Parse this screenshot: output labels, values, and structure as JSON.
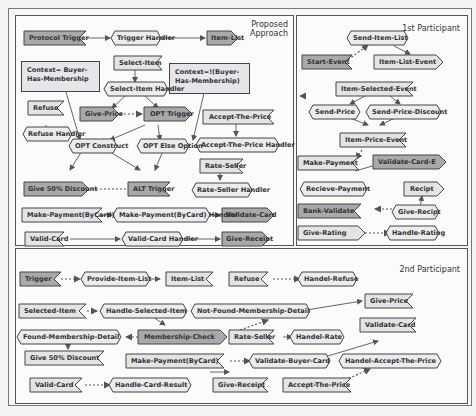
{
  "panels": {
    "proposed": {
      "title_line1": "Proposed",
      "title_line2": "Approach"
    },
    "first": {
      "title": "1st Participant"
    },
    "second": {
      "title": "2nd Participant"
    }
  },
  "colors": {
    "dark_node": "#a9a9ad",
    "light_node": "#e4e4e6",
    "handler_node": "#ececee",
    "border": "#444444"
  },
  "proposed": {
    "protocol_trigger": "Protocol Trigger",
    "trigger_handler": "Trigger Handler",
    "item_list": "Item-List",
    "select_item": "Select-Item",
    "context_has": "Context= Buyer-Has-Membership",
    "context_not": "Context=!(Buyer-Has-Membership)",
    "select_item_handler": "Select-Item Handler",
    "refuse": "Refuse",
    "refuse_handler": "Refuse Handler",
    "give_price": "Give-Price",
    "opt_trigger": "OPT Trigger",
    "accept_the_price": "Accept-The-Price",
    "accept_the_price_handler": "Accept-The-Price Handler",
    "opt_construct": "OPT Construct",
    "opt_else_option": "OPT Else Option",
    "rate_seller": "Rate-Seller",
    "rate_seller_handler": "Rate-Seller Handler",
    "give_50_discount": "Give 50% Discount",
    "alt_trigger": "ALT Trigger",
    "make_payment": "Make-Payment(ByCard)",
    "make_payment_handler": "Make-Payment(ByCard) Handler",
    "validate_card": "Validate-Card",
    "valid_card": "Valid-Card",
    "valid_card_handler": "Valid-Card Handler",
    "give_receipt": "Give-Receipt"
  },
  "first": {
    "send_item_list": "Send-Item-List",
    "start_event": "Start-Event",
    "item_list_event": "Item-List-Event",
    "item_selected_event": "Item-Selected-Event",
    "send_price": "Send-Price",
    "send_price_discount": "Send-Price-Discount",
    "item_price_event": "Item-Price-Event",
    "make_payment": "Make-Payment",
    "validate_card_e": "Validate-Card-E",
    "recieve_payment": "Recieve-Payment",
    "recipt": "Recipt",
    "bank_validate": "Bank-Validate",
    "give_recipt": "Give-Recipt",
    "give_rating": "Give-Rating",
    "handle_rating": "Handle-Rating"
  },
  "second": {
    "trigger": "Trigger",
    "provide_item_list": "Provide-Item-List",
    "item_list": "Item-List",
    "refuse": "Refuse",
    "handel_refuse": "Handel-Refuse",
    "selected_item": "Selected-Item",
    "handle_selected_item": "Handle-Selected-Item",
    "not_found_membership_detail": "Not-Found-Membership-Detail",
    "give_price": "Give-Price",
    "found_membership_detail": "Found-Membership-Detail",
    "membership_check": "Membership-Check",
    "rate_seller": "Rate-Seller",
    "handel_rate": "Handel-Rate",
    "validate_card": "Validate-Card",
    "give_50_discount": "Give 50% Discount",
    "make_payment": "Make-Payment(ByCard)",
    "validate_buyer_card": "Validate-Buyer-Card",
    "handel_accept_the_price": "Handel-Accept-The-Price",
    "valid_card": "Valid-Card",
    "handle_card_result": "Handle-Card-Result",
    "give_receipt": "Give-Receipt",
    "accept_the_price": "Accept-The-Price"
  }
}
